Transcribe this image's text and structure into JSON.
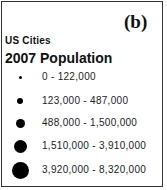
{
  "chart_data": {
    "type": "legend",
    "panel_label": "(b)",
    "subtitle": "US Cities",
    "title": "2007 Population",
    "symbol": "graduated-circle",
    "symbol_color": "#000000",
    "classes": [
      {
        "label": "0 - 122,000",
        "min": 0,
        "max": 122000,
        "size_rank": 1
      },
      {
        "label": "123,000 - 487,000",
        "min": 123000,
        "max": 487000,
        "size_rank": 2
      },
      {
        "label": "488,000 - 1,500,000",
        "min": 488000,
        "max": 1500000,
        "size_rank": 3
      },
      {
        "label": "1,510,000 - 3,910,000",
        "min": 1510000,
        "max": 3910000,
        "size_rank": 4
      },
      {
        "label": "3,920,000 - 8,320,000",
        "min": 3920000,
        "max": 8320000,
        "size_rank": 5
      }
    ]
  }
}
